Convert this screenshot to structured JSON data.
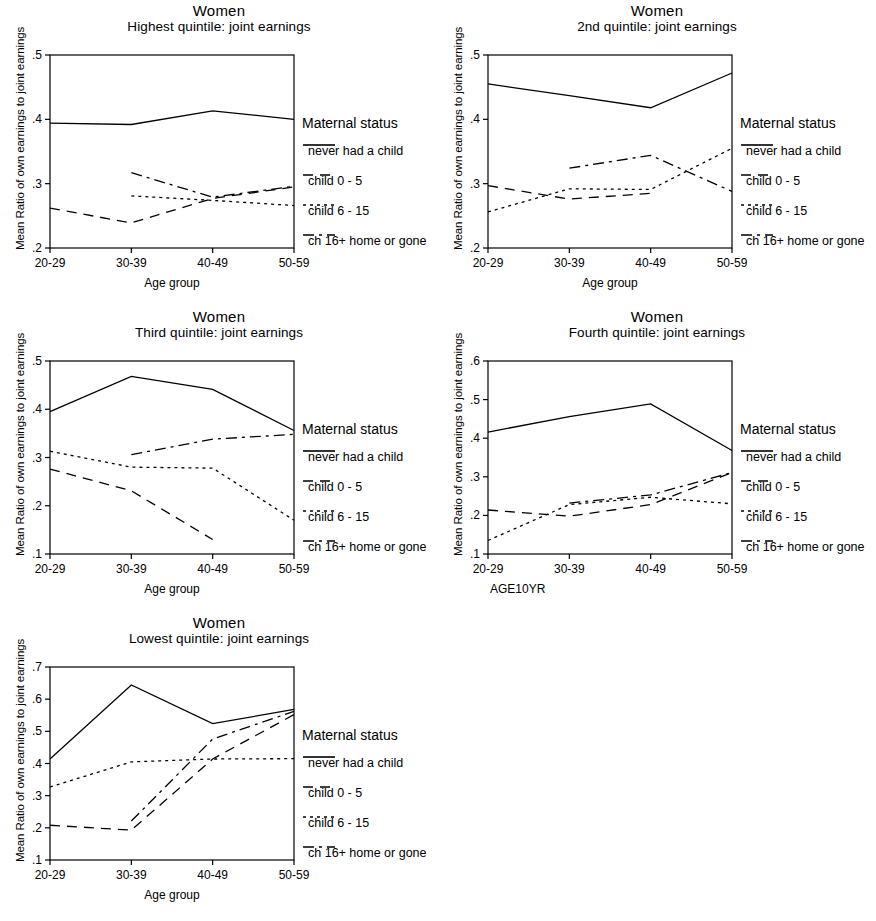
{
  "figure": {
    "title": "Women",
    "legend_title": "Maternal status",
    "series_labels": [
      "never had a child",
      "child 0 - 5",
      "child 6 - 15",
      "ch 16+ home or gone"
    ],
    "series_styles": [
      "solid",
      "dashed",
      "dotted",
      "dash-dot"
    ],
    "categories": [
      "20-29",
      "30-39",
      "40-49",
      "50-59"
    ],
    "ylabel": "Mean Ratio of own earnings to joint earnings"
  },
  "chart_data": [
    {
      "type": "line",
      "panel": "highest-quintile",
      "title": "Women",
      "subtitle": "Highest quintile: joint earnings",
      "xlabel": "Age group",
      "ylabel": "Mean Ratio of own earnings to joint earnings",
      "categories": [
        "20-29",
        "30-39",
        "40-49",
        "50-59"
      ],
      "ylim": [
        0.2,
        0.5
      ],
      "yticks": [
        ".2",
        ".3",
        ".4",
        ".5"
      ],
      "grid": false,
      "legend_position": "right",
      "series": [
        {
          "name": "never had a child",
          "style": "solid",
          "values": [
            0.394,
            0.392,
            0.413,
            0.4
          ]
        },
        {
          "name": "child 0 - 5",
          "style": "dashed",
          "values": [
            0.262,
            0.239,
            0.277,
            0.295
          ]
        },
        {
          "name": "child 6 - 15",
          "style": "dotted",
          "values": [
            null,
            0.281,
            0.274,
            0.266
          ]
        },
        {
          "name": "ch 16+ home or gone",
          "style": "dash-dot",
          "values": [
            null,
            0.317,
            0.279,
            0.296
          ]
        }
      ]
    },
    {
      "type": "line",
      "panel": "second-quintile",
      "title": "Women",
      "subtitle": "2nd quintile: joint earnings",
      "xlabel": "Age group",
      "ylabel": "Mean Ratio of own earnings to joint earnings",
      "categories": [
        "20-29",
        "30-39",
        "40-49",
        "50-59"
      ],
      "ylim": [
        0.2,
        0.5
      ],
      "yticks": [
        ".2",
        ".3",
        ".4",
        ".5"
      ],
      "grid": false,
      "legend_position": "right",
      "series": [
        {
          "name": "never had a child",
          "style": "solid",
          "values": [
            0.455,
            0.437,
            0.418,
            0.472
          ]
        },
        {
          "name": "child 0 - 5",
          "style": "dashed",
          "values": [
            0.297,
            0.276,
            0.285,
            null
          ]
        },
        {
          "name": "child 6 - 15",
          "style": "dotted",
          "values": [
            0.256,
            0.292,
            0.291,
            0.355
          ]
        },
        {
          "name": "ch 16+ home or gone",
          "style": "dash-dot",
          "values": [
            null,
            0.324,
            0.344,
            0.288
          ]
        }
      ]
    },
    {
      "type": "line",
      "panel": "third-quintile",
      "title": "Women",
      "subtitle": "Third quintile: joint earnings",
      "xlabel": "Age group",
      "ylabel": "Mean Ratio of own earnings to joint earnings",
      "categories": [
        "20-29",
        "30-39",
        "40-49",
        "50-59"
      ],
      "ylim": [
        0.1,
        0.5
      ],
      "yticks": [
        ".1",
        ".2",
        ".3",
        ".4",
        ".5"
      ],
      "grid": false,
      "legend_position": "right",
      "series": [
        {
          "name": "never had a child",
          "style": "solid",
          "values": [
            0.395,
            0.468,
            0.441,
            0.356
          ]
        },
        {
          "name": "child 0 - 5",
          "style": "dashed",
          "values": [
            0.276,
            0.231,
            0.13,
            null
          ]
        },
        {
          "name": "child 6 - 15",
          "style": "dotted",
          "values": [
            0.313,
            0.28,
            0.278,
            0.17
          ]
        },
        {
          "name": "ch 16+ home or gone",
          "style": "dash-dot",
          "values": [
            null,
            0.306,
            0.338,
            0.348
          ]
        }
      ]
    },
    {
      "type": "line",
      "panel": "fourth-quintile",
      "title": "Women",
      "subtitle": "Fourth quintile: joint earnings",
      "xlabel": "AGE10YR",
      "ylabel": "Mean Ratio of own earnings to joint earnings",
      "categories": [
        "20-29",
        "30-39",
        "40-49",
        "50-59"
      ],
      "ylim": [
        0.1,
        0.6
      ],
      "yticks": [
        ".1",
        ".2",
        ".3",
        ".4",
        ".5",
        ".6"
      ],
      "grid": false,
      "legend_position": "right",
      "series": [
        {
          "name": "never had a child",
          "style": "solid",
          "values": [
            0.416,
            0.456,
            0.489,
            0.368
          ]
        },
        {
          "name": "child 0 - 5",
          "style": "dashed",
          "values": [
            0.214,
            0.198,
            0.228,
            0.311
          ]
        },
        {
          "name": "child 6 - 15",
          "style": "dotted",
          "values": [
            0.135,
            0.228,
            0.247,
            0.23
          ]
        },
        {
          "name": "ch 16+ home or gone",
          "style": "dash-dot",
          "values": [
            null,
            0.232,
            0.253,
            0.311
          ]
        }
      ]
    },
    {
      "type": "line",
      "panel": "lowest-quintile",
      "title": "Women",
      "subtitle": "Lowest quintile: joint earnings",
      "xlabel": "Age group",
      "ylabel": "Mean Ratio of own earnings to joint earnings",
      "categories": [
        "20-29",
        "30-39",
        "40-49",
        "50-59"
      ],
      "ylim": [
        0.1,
        0.7
      ],
      "yticks": [
        ".1",
        ".2",
        ".3",
        ".4",
        ".5",
        ".6",
        ".7"
      ],
      "grid": false,
      "legend_position": "right",
      "series": [
        {
          "name": "never had a child",
          "style": "solid",
          "values": [
            0.414,
            0.644,
            0.524,
            0.568
          ]
        },
        {
          "name": "child 0 - 5",
          "style": "dashed",
          "values": [
            0.208,
            0.193,
            0.414,
            0.552
          ]
        },
        {
          "name": "child 6 - 15",
          "style": "dotted",
          "values": [
            0.327,
            0.405,
            0.414,
            0.415
          ]
        },
        {
          "name": "ch 16+ home or gone",
          "style": "dash-dot",
          "values": [
            null,
            0.221,
            0.476,
            0.562
          ]
        }
      ]
    }
  ],
  "panels_layout": [
    {
      "name": "highest-quintile",
      "left": 0,
      "top": 0
    },
    {
      "name": "second-quintile",
      "left": 438,
      "top": 0
    },
    {
      "name": "third-quintile",
      "left": 0,
      "top": 306
    },
    {
      "name": "fourth-quintile",
      "left": 438,
      "top": 306
    },
    {
      "name": "lowest-quintile",
      "left": 0,
      "top": 612
    }
  ]
}
